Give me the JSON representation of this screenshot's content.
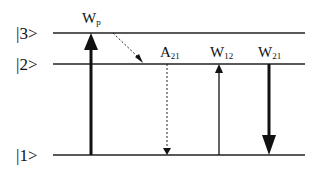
{
  "diagram": {
    "levels": [
      {
        "label": "|3>",
        "y": 33
      },
      {
        "label": "|2>",
        "y": 64
      },
      {
        "label": "|1>",
        "y": 155
      }
    ],
    "transitions": [
      {
        "name": "pump",
        "label_main": "W",
        "label_sub": "p",
        "from": "|1>",
        "to": "|3>",
        "style": "thick-solid"
      },
      {
        "name": "nonradiative",
        "label_main": "",
        "label_sub": "",
        "from": "|3>",
        "to": "|2>",
        "style": "dotted"
      },
      {
        "name": "spontaneous",
        "label_main": "A",
        "label_sub": "21",
        "from": "|2>",
        "to": "|1>",
        "style": "dotted"
      },
      {
        "name": "absorption",
        "label_main": "W",
        "label_sub": "12",
        "from": "|1>",
        "to": "|2>",
        "style": "thin-solid"
      },
      {
        "name": "stimulated",
        "label_main": "W",
        "label_sub": "21",
        "from": "|2>",
        "to": "|1>",
        "style": "thick-solid"
      }
    ]
  }
}
